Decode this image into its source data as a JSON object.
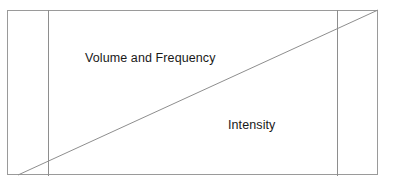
{
  "diagram": {
    "title": "",
    "background_color": "#ffffff",
    "line_color": "#9a9a9a",
    "text_color": "#191919",
    "frame": {
      "name": "outer-rectangle",
      "x": 7,
      "y": 10,
      "width": 371,
      "height": 165
    },
    "dividers": [
      {
        "name": "left-divider",
        "x": 48,
        "orientation": "vertical"
      },
      {
        "name": "right-divider",
        "x": 337,
        "orientation": "vertical"
      }
    ],
    "diagonal": {
      "name": "diagonal-line",
      "x1": 18,
      "y1": 175,
      "x2": 378,
      "y2": 10,
      "color": "#8e8e8e",
      "width": 1
    },
    "labels": [
      {
        "name": "label-volume-frequency",
        "text": "Volume and Frequency",
        "x": 85,
        "y": 52
      },
      {
        "name": "label-intensity",
        "text": "Intensity",
        "x": 228,
        "y": 119
      }
    ]
  }
}
